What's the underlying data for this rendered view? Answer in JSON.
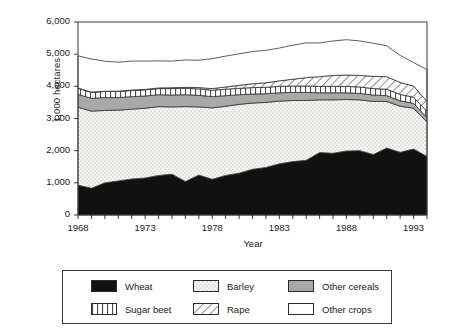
{
  "chart_data": {
    "type": "area",
    "title": "",
    "subtitle": "",
    "xlabel": "Year",
    "ylabel": "1,000 hectares",
    "xlim": [
      1968,
      1994
    ],
    "ylim": [
      0,
      6000
    ],
    "grid": false,
    "legend_position": "bottom",
    "stacked": true,
    "ytick_labels": [
      "0",
      "1,000",
      "2,000",
      "3,000",
      "4,000",
      "5,000",
      "6,000"
    ],
    "ytick_values": [
      0,
      1000,
      2000,
      3000,
      4000,
      5000,
      6000
    ],
    "xtick_labels": [
      "1968",
      "1973",
      "1978",
      "1983",
      "1988",
      "1993"
    ],
    "xtick_values": [
      1968,
      1973,
      1978,
      1983,
      1988,
      1993
    ],
    "x": [
      1968,
      1969,
      1970,
      1971,
      1972,
      1973,
      1974,
      1975,
      1976,
      1977,
      1978,
      1979,
      1980,
      1981,
      1982,
      1983,
      1984,
      1985,
      1986,
      1987,
      1988,
      1989,
      1990,
      1991,
      1992,
      1993,
      1994
    ],
    "series": [
      {
        "name": "Wheat",
        "fill": "#111111",
        "pattern": "solid-black",
        "values": [
          930,
          830,
          1000,
          1060,
          1120,
          1150,
          1230,
          1270,
          1040,
          1240,
          1110,
          1230,
          1300,
          1420,
          1480,
          1590,
          1660,
          1700,
          1940,
          1920,
          1990,
          2000,
          1880,
          2080,
          1950,
          2050,
          1820
        ]
      },
      {
        "name": "Barley",
        "fill": "#f2f2ee",
        "pattern": "fine-dots",
        "values": [
          2420,
          2400,
          2250,
          2200,
          2170,
          2170,
          2140,
          2090,
          2330,
          2120,
          2220,
          2150,
          2140,
          2060,
          2020,
          1950,
          1900,
          1860,
          1640,
          1660,
          1600,
          1580,
          1650,
          1450,
          1430,
          1270,
          1070
        ]
      },
      {
        "name": "Other cereals",
        "fill": "#a9a9a9",
        "pattern": "solid-gray",
        "values": [
          400,
          400,
          400,
          390,
          390,
          380,
          370,
          370,
          370,
          360,
          350,
          330,
          300,
          280,
          270,
          260,
          250,
          250,
          220,
          220,
          210,
          200,
          200,
          180,
          170,
          150,
          140
        ]
      },
      {
        "name": "Sugar beet",
        "fill": "#ffffff",
        "pattern": "vertical-lines",
        "values": [
          190,
          180,
          190,
          190,
          190,
          190,
          190,
          200,
          200,
          200,
          200,
          200,
          200,
          200,
          200,
          200,
          200,
          200,
          200,
          200,
          200,
          200,
          200,
          200,
          200,
          190,
          190
        ]
      },
      {
        "name": "Rape",
        "fill": "#ffffff",
        "pattern": "diagonal-hatch",
        "values": [
          10,
          10,
          10,
          10,
          15,
          15,
          20,
          25,
          30,
          40,
          50,
          70,
          90,
          120,
          140,
          170,
          210,
          260,
          300,
          340,
          350,
          360,
          380,
          390,
          370,
          350,
          310
        ]
      },
      {
        "name": "Other crops",
        "fill": "#ffffff",
        "pattern": "plain-white",
        "values": [
          1000,
          1030,
          930,
          900,
          900,
          880,
          840,
          830,
          850,
          850,
          930,
          960,
          980,
          1000,
          1010,
          1020,
          1060,
          1080,
          1050,
          1070,
          1100,
          1070,
          1030,
          960,
          840,
          730,
          990
        ]
      }
    ],
    "totals": [
      4950,
      4850,
      4780,
      4750,
      4785,
      4785,
      4790,
      4785,
      4820,
      4810,
      4860,
      4940,
      5010,
      5080,
      5120,
      5190,
      5280,
      5350,
      5350,
      5410,
      5450,
      5410,
      5340,
      5260,
      4960,
      4740,
      4520
    ]
  },
  "axes": {
    "y_title": "1,000 hectares",
    "x_title": "Year"
  },
  "legend": {
    "items": [
      {
        "label": "Wheat",
        "swatch": "solid-black"
      },
      {
        "label": "Barley",
        "swatch": "fine-dots"
      },
      {
        "label": "Other cereals",
        "swatch": "solid-gray"
      },
      {
        "label": "Sugar beet",
        "swatch": "vertical-lines"
      },
      {
        "label": "Rape",
        "swatch": "diagonal-hatch"
      },
      {
        "label": "Other crops",
        "swatch": "plain-white"
      }
    ]
  },
  "colors": {
    "wheat": "#111111",
    "barley": "#f2f2ee",
    "other_cereals": "#a9a9a9",
    "sugar_beet": "#ffffff",
    "rape": "#ffffff",
    "other_crops": "#ffffff",
    "axis": "#3a3a3a",
    "text": "#1a1a1a"
  }
}
